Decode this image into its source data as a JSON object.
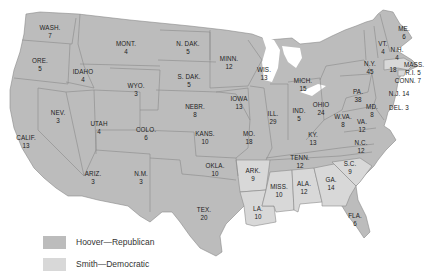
{
  "colors": {
    "republican": "#bcbcbc",
    "democratic": "#d8d8d8",
    "border": "#8a8a8a",
    "background": "#ffffff"
  },
  "legend": [
    {
      "label": "Hoover—Republican",
      "party": "republican"
    },
    {
      "label": "Smith—Democratic",
      "party": "democratic"
    }
  ],
  "states": {
    "wash": {
      "name": "WASH.",
      "votes": "7",
      "party": "republican"
    },
    "ore": {
      "name": "ORE.",
      "votes": "5",
      "party": "republican"
    },
    "calif": {
      "name": "CALIF.",
      "votes": "13",
      "party": "republican"
    },
    "idaho": {
      "name": "IDAHO",
      "votes": "4",
      "party": "republican"
    },
    "nev": {
      "name": "NEV.",
      "votes": "3",
      "party": "republican"
    },
    "mont": {
      "name": "MONT.",
      "votes": "4",
      "party": "republican"
    },
    "wyo": {
      "name": "WYO.",
      "votes": "3",
      "party": "republican"
    },
    "utah": {
      "name": "UTAH",
      "votes": "4",
      "party": "republican"
    },
    "ariz": {
      "name": "ARIZ.",
      "votes": "3",
      "party": "republican"
    },
    "colo": {
      "name": "COLO.",
      "votes": "6",
      "party": "republican"
    },
    "nm": {
      "name": "N.M.",
      "votes": "3",
      "party": "republican"
    },
    "ndak": {
      "name": "N. DAK.",
      "votes": "5",
      "party": "republican"
    },
    "sdak": {
      "name": "S. DAK.",
      "votes": "5",
      "party": "republican"
    },
    "nebr": {
      "name": "NEBR.",
      "votes": "8",
      "party": "republican"
    },
    "kans": {
      "name": "KANS.",
      "votes": "10",
      "party": "republican"
    },
    "okla": {
      "name": "OKLA.",
      "votes": "10",
      "party": "republican"
    },
    "tex": {
      "name": "TEX.",
      "votes": "20",
      "party": "republican"
    },
    "minn": {
      "name": "MINN.",
      "votes": "12",
      "party": "republican"
    },
    "iowa": {
      "name": "IOWA",
      "votes": "13",
      "party": "republican"
    },
    "mo": {
      "name": "MO.",
      "votes": "18",
      "party": "republican"
    },
    "ark": {
      "name": "ARK.",
      "votes": "9",
      "party": "democratic"
    },
    "la": {
      "name": "LA.",
      "votes": "10",
      "party": "democratic"
    },
    "wis": {
      "name": "WIS.",
      "votes": "13",
      "party": "republican"
    },
    "ill": {
      "name": "ILL.",
      "votes": "29",
      "party": "republican"
    },
    "mich": {
      "name": "MICH.",
      "votes": "15",
      "party": "republican"
    },
    "ind": {
      "name": "IND.",
      "votes": "5",
      "party": "republican"
    },
    "ohio": {
      "name": "OHIO",
      "votes": "24",
      "party": "republican"
    },
    "ky": {
      "name": "KY.",
      "votes": "13",
      "party": "republican"
    },
    "tenn": {
      "name": "TENN.",
      "votes": "12",
      "party": "republican"
    },
    "miss": {
      "name": "MISS.",
      "votes": "10",
      "party": "democratic"
    },
    "ala": {
      "name": "ALA.",
      "votes": "12",
      "party": "democratic"
    },
    "ga": {
      "name": "GA.",
      "votes": "14",
      "party": "democratic"
    },
    "fla": {
      "name": "FLA.",
      "votes": "6",
      "party": "republican"
    },
    "sc": {
      "name": "S.C.",
      "votes": "9",
      "party": "democratic"
    },
    "nc": {
      "name": "N.C.",
      "votes": "12",
      "party": "republican"
    },
    "va": {
      "name": "VA.",
      "votes": "12",
      "party": "republican"
    },
    "wva": {
      "name": "W.VA.",
      "votes": "8",
      "party": "republican"
    },
    "md": {
      "name": "MD.",
      "votes": "8",
      "party": "republican"
    },
    "del": {
      "name": "DEL.",
      "votes": "3",
      "party": "republican"
    },
    "pa": {
      "name": "PA.",
      "votes": "38",
      "party": "republican"
    },
    "nj": {
      "name": "N.J.",
      "votes": "14",
      "party": "republican"
    },
    "ny": {
      "name": "N.Y.",
      "votes": "45",
      "party": "republican"
    },
    "conn": {
      "name": "CONN.",
      "votes": "7",
      "party": "republican"
    },
    "ri": {
      "name": "R.I.",
      "votes": "5",
      "party": "democratic"
    },
    "mass": {
      "name": "MASS.",
      "votes": "18",
      "party": "democratic"
    },
    "vt": {
      "name": "VT.",
      "votes": "4",
      "party": "republican"
    },
    "nh": {
      "name": "N.H.",
      "votes": "4",
      "party": "republican"
    },
    "me": {
      "name": "ME.",
      "votes": "6",
      "party": "republican"
    }
  }
}
